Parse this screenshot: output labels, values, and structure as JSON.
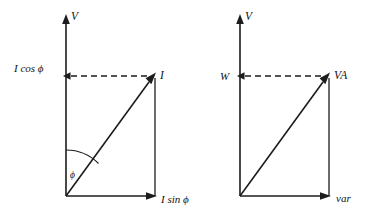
{
  "figure": {
    "background_color": "#ffffff",
    "line_color": "#1c1c1c",
    "text_color": "#111111"
  },
  "diagrams": [
    {
      "id": "current-triangle",
      "vertical_axis_label": "V",
      "horizontal_component_label": "I sin ϕ",
      "vertical_component_label": "I cos ϕ",
      "resultant_label": "I",
      "angle_label": "ϕ",
      "has_angle_arc": true
    },
    {
      "id": "power-triangle",
      "vertical_axis_label": "V",
      "horizontal_component_label": "var",
      "vertical_component_label": "W",
      "resultant_label": "VA",
      "angle_label": "",
      "has_angle_arc": false
    }
  ]
}
